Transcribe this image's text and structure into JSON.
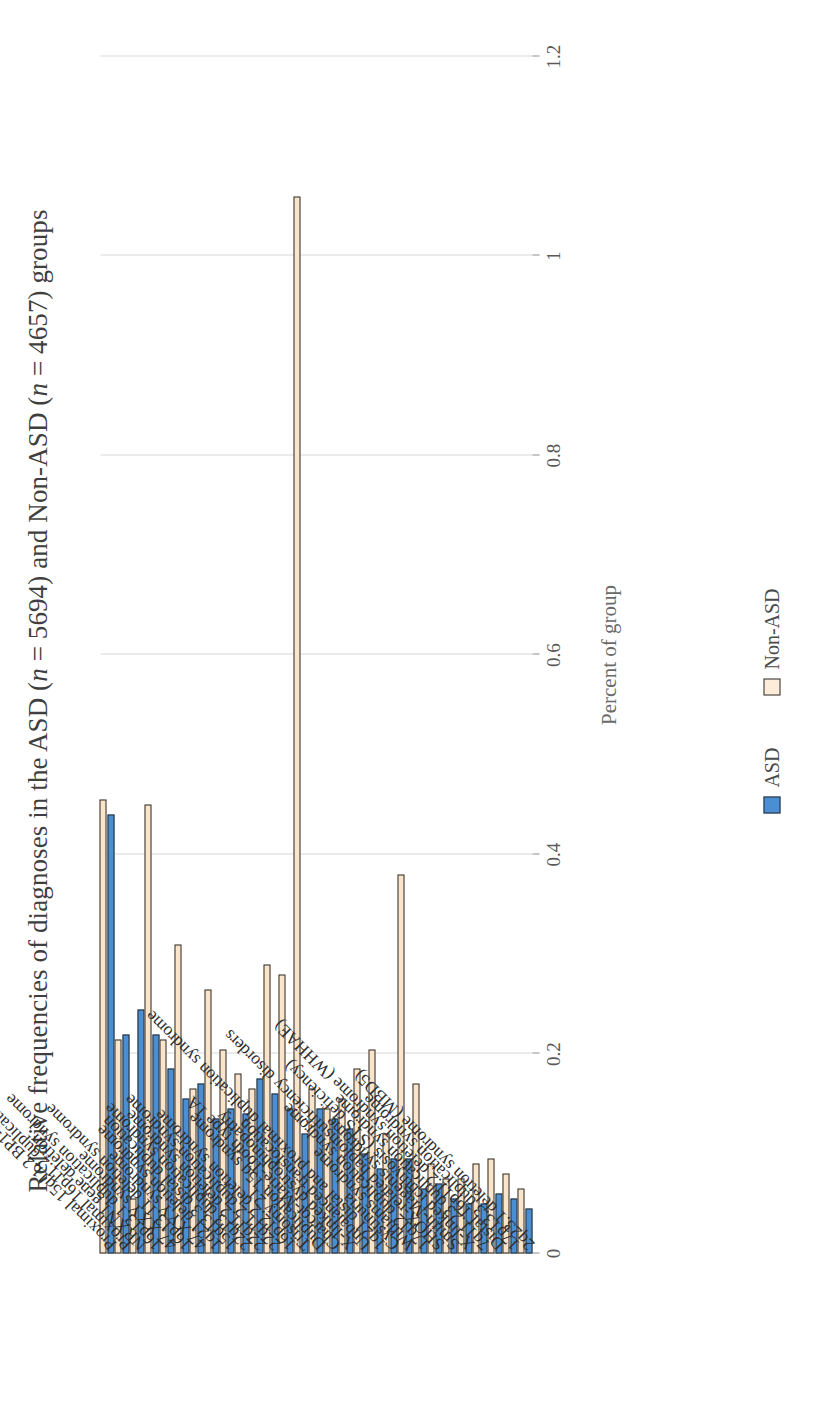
{
  "chart_data": {
    "type": "bar",
    "orientation": "vertical-bars-rotated-page",
    "title": "Relative frequencies of diagnoses in the ASD (n = 5694) and Non-ASD (n = 4657) groups",
    "title_parts": {
      "a": "Relative frequencies of diagnoses in the ASD (",
      "n1": "n",
      "b": " = 5694) and Non-ASD (",
      "n2": "n",
      "c": " = 4657) groups"
    },
    "xlabel": "",
    "ylabel": "Percent of group",
    "ylim": [
      0,
      1.2
    ],
    "yticks": [
      0,
      0.2,
      0.4,
      0.6,
      0.8,
      1,
      1.2
    ],
    "ytick_labels": [
      "0",
      "0.2",
      "0.4",
      "0.6",
      "0.8",
      "1",
      "1.2"
    ],
    "grid": true,
    "legend_position": "bottom",
    "colors": {
      "asd": "#4a8fd4",
      "nonasd": "#fae4ca",
      "bar_outline": "#2b2b2b",
      "gridline": "#d8d8d8",
      "axis": "#8f8f8f"
    },
    "categories": [
      "Proximal 15q11.2 BP1-BP2 deletion syndrome",
      "Proximal 16p11.2 duplication syndrome",
      "NRXN1 gene deletion",
      "16p13.1 duplication syndrome",
      "47,XXY syndrome",
      "16p13.11 deletion syndrome",
      "47,XYY syndrome",
      "1q21 deletion syndrome",
      "15q13.3 distal duplication",
      "22q13 duplication syndrome",
      "22q11.2 deletion syndrome",
      "22q11.2 duplication syndrome",
      "16p12.2 deletion syndrome",
      "Trisomy 21",
      "Duplication 15q syndrome",
      "Charcot-Marie-Tooth type 1A",
      "X-linked dystrophinopathy",
      "Unbalanced translocation",
      "1q21 distal and proximal duplication syndrome",
      "Cystinuria",
      "Williams syndrome",
      "17q12 duplication syndrome",
      "SHOX-related haploinsufficiency disorders",
      "Smith-Magenis syndrome",
      "X-linked ichthyosis (STS deficiency)",
      "7q11.23 duplication syndrome",
      "Distal 16p11.2 deletion syndrome (WHHAE)",
      "17p13.3 duplication syndrome",
      "2q23.1 deletion syndrome (MBD5)"
    ],
    "series": [
      {
        "name": "ASD",
        "color": "#4a8fd4",
        "values": [
          0.44,
          0.22,
          0.245,
          0.22,
          0.185,
          0.155,
          0.17,
          0.135,
          0.145,
          0.14,
          0.175,
          0.16,
          0.145,
          0.12,
          0.145,
          0.135,
          0.125,
          0.1,
          0.085,
          0.095,
          0.095,
          0.065,
          0.07,
          0.055,
          0.05,
          0.05,
          0.06,
          0.055,
          0.045
        ]
      },
      {
        "name": "Non-ASD",
        "color": "#fae4ca",
        "values": [
          0.455,
          0.215,
          0.055,
          0.45,
          0.215,
          0.31,
          0.165,
          0.265,
          0.205,
          0.18,
          0.165,
          0.29,
          0.28,
          1.06,
          0.165,
          0.145,
          0.155,
          0.185,
          0.205,
          0.12,
          0.38,
          0.17,
          0.09,
          0.075,
          0.075,
          0.09,
          0.095,
          0.08,
          0.065
        ]
      }
    ]
  },
  "legend": {
    "items": [
      {
        "label": "ASD",
        "color": "#4a8fd4"
      },
      {
        "label": "Non-ASD",
        "color": "#fdecd9"
      }
    ]
  }
}
